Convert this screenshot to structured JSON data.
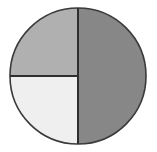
{
  "figure": {
    "name": "pie-chart-icon",
    "background_color": "#ffffff",
    "width": 157,
    "height": 152
  },
  "chart_data": {
    "type": "pie",
    "title": "",
    "subtitle": "",
    "xlabel": "",
    "ylabel": "",
    "grid": false,
    "legend_position": "none",
    "labels_shown": false,
    "center_x": 78,
    "center_y": 76,
    "radius": 68,
    "start_angle_deg": -90,
    "direction": "clockwise",
    "outline_color": "#3a3a3a",
    "outline_width": 1.6,
    "divider_color": "#2e2e2e",
    "divider_width": 2.0,
    "categories": [
      "Right half",
      "Top left quadrant",
      "Bottom left quadrant"
    ],
    "values": [
      50,
      25,
      25
    ],
    "angles_deg": [
      180,
      90,
      90
    ],
    "colors": [
      "#878787",
      "#b0b0b0",
      "#efefef"
    ],
    "slices": [
      {
        "name": "slice-right-half",
        "label": "Right half",
        "value": 50,
        "angle_deg": 180,
        "start_deg": -90,
        "end_deg": 90,
        "color": "#878787",
        "path": "M 78 76 L 78 8 A 68 68 0 0 1 78 144 Z"
      },
      {
        "name": "slice-bottom-left-quadrant",
        "label": "Bottom left quadrant",
        "value": 25,
        "angle_deg": 90,
        "start_deg": 90,
        "end_deg": 180,
        "color": "#efefef",
        "path": "M 78 76 L 78 144 A 68 68 0 0 1 10 76 Z"
      },
      {
        "name": "slice-top-left-quadrant",
        "label": "Top left quadrant",
        "value": 25,
        "angle_deg": 90,
        "start_deg": 180,
        "end_deg": 270,
        "color": "#b0b0b0",
        "path": "M 78 76 L 10 76 A 68 68 0 0 1 78 8 Z"
      }
    ],
    "dividers": [
      {
        "name": "divider-vertical",
        "x1": 78,
        "y1": 8,
        "x2": 78,
        "y2": 144
      },
      {
        "name": "divider-horizontal-left",
        "x1": 10,
        "y1": 76,
        "x2": 78,
        "y2": 76
      }
    ]
  }
}
